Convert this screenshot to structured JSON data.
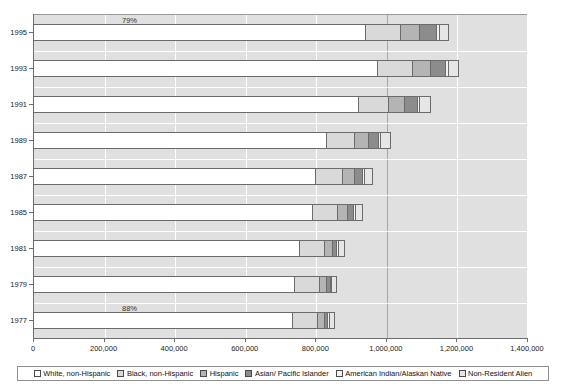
{
  "chart_data": {
    "type": "bar",
    "orientation": "horizontal",
    "stacked": true,
    "title": "",
    "xlabel": "",
    "ylabel": "",
    "xlim": [
      0,
      1400000
    ],
    "grid": true,
    "legend_position": "bottom",
    "categories": [
      "1995",
      "1993",
      "1991",
      "1989",
      "1987",
      "1985",
      "1981",
      "1979",
      "1977"
    ],
    "xticks": [
      0,
      200000,
      400000,
      600000,
      800000,
      1000000,
      1200000,
      1400000
    ],
    "xtick_labels": [
      "0",
      "200,000",
      "400,000",
      "600,000",
      "800,000",
      "1,000,000",
      "1,200,000",
      "1,400,000"
    ],
    "series": [
      {
        "name": "White, non-Hispanic",
        "color": "#ffffff",
        "values": [
          940000,
          975000,
          920000,
          830000,
          800000,
          790000,
          755000,
          740000,
          735000
        ]
      },
      {
        "name": "Black, non-Hispanic",
        "color": "#d9d9d9",
        "values": [
          100000,
          98000,
          85000,
          80000,
          76000,
          72000,
          70000,
          70000,
          71000
        ]
      },
      {
        "name": "Hispanic",
        "color": "#b4b4b4",
        "values": [
          55000,
          52000,
          47000,
          40000,
          33000,
          27000,
          22000,
          20000,
          18000
        ]
      },
      {
        "name": "Asian/ Pacific Islander",
        "color": "#8c8c8c",
        "values": [
          48000,
          44000,
          37000,
          29000,
          23000,
          18000,
          13000,
          11000,
          10000
        ]
      },
      {
        "name": "American Indian/Alaskan Native",
        "color": "#f2f2f2",
        "values": [
          8000,
          7000,
          6000,
          5500,
          5000,
          4500,
          4000,
          3800,
          3600
        ]
      },
      {
        "name": "Non-Resident Alien",
        "color": "#e6e6e6",
        "values": [
          29000,
          30000,
          33000,
          30000,
          27000,
          24000,
          20000,
          18000,
          17000
        ]
      }
    ],
    "annotations": [
      {
        "text": "79%",
        "category": "1995",
        "note": "share of White, non-Hispanic in 1995"
      },
      {
        "text": "88%",
        "category": "1977",
        "note": "share of White, non-Hispanic in 1977"
      }
    ]
  },
  "legend": {
    "items": [
      {
        "label": "White, non-Hispanic",
        "color": "#ffffff"
      },
      {
        "label": "Black, non-Hispanic",
        "color": "#d9d9d9"
      },
      {
        "label": "Hispanic",
        "color": "#b4b4b4"
      },
      {
        "label": "Asian/ Pacific Islander",
        "color": "#8c8c8c"
      },
      {
        "label": "American Indian/Alaskan Native",
        "color": "#f2f2f2"
      },
      {
        "label": "Non-Resident Alien",
        "color": "#e6e6e6"
      }
    ]
  }
}
